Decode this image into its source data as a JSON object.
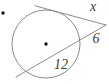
{
  "figure": {
    "type": "geometry-diagram",
    "labels": {
      "tangent_label": "x",
      "external_segment_label": "6",
      "chord_label": "12"
    },
    "colors": {
      "background": "#ffffff",
      "line": "#8c8c8c",
      "text": "#3a3a3a",
      "dot": "#151515"
    }
  }
}
